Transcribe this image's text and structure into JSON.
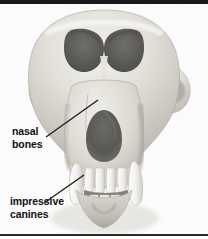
{
  "figure": {
    "background_color": "#ffffff",
    "frame_color": "#1a1a1a",
    "bone_light": "#efeeea",
    "bone_mid": "#d8d6cf",
    "bone_shadow": "#b9b6ad",
    "cavity_dark": "#5d5b57",
    "tooth_color": "#f6f5f1",
    "label_color": "#111111",
    "leader_color": "#1b1b1b"
  },
  "labels": {
    "nasal": {
      "line1": "nasal",
      "line2": "bones"
    },
    "canines": {
      "line1": "impressive",
      "line2": "canines"
    }
  },
  "anatomy": {
    "cranium": "cranial-vault",
    "orbit_left": "left-eye-socket",
    "orbit_right": "right-eye-socket",
    "nasal_aperture": "nasal-aperture",
    "zygomatic_left": "left-zygomatic-arch",
    "zygomatic_right": "right-zygomatic-arch",
    "muzzle": "muzzle-snout",
    "canine_left": "left-canine-tooth",
    "canine_right": "right-canine-tooth",
    "incisors": "upper-incisors",
    "mandible": "mandible-lower-jaw"
  }
}
